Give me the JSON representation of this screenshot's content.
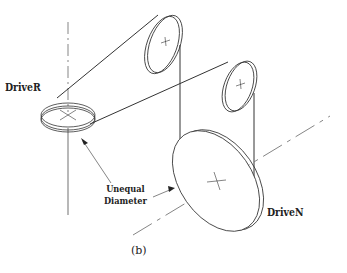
{
  "diagram": {
    "type": "belt-drive-isometric",
    "labels": {
      "driver": "DriveR",
      "unequal_line1": "Unequal",
      "unequal_line2": "Diameter",
      "driven": "DriveN",
      "caption": "(b)"
    },
    "components": [
      {
        "name": "driver-pulley",
        "label": "DriveR",
        "orientation": "horizontal"
      },
      {
        "name": "idler-pulley-top",
        "orientation": "vertical"
      },
      {
        "name": "idler-pulley-right",
        "orientation": "vertical"
      },
      {
        "name": "driven-pulley",
        "label": "DriveN",
        "orientation": "vertical"
      }
    ],
    "annotation": "Unequal Diameter",
    "colors": {
      "line": "#333333",
      "background": "#ffffff"
    }
  }
}
